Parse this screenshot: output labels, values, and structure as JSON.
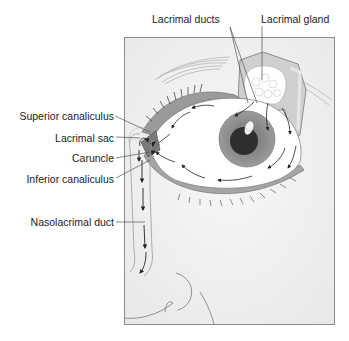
{
  "labels": {
    "lacrimal_ducts": "Lacrimal ducts",
    "lacrimal_gland": "Lacrimal gland",
    "superior_canaliculus": "Superior canaliculus",
    "lacrimal_sac": "Lacrimal sac",
    "caruncle": "Caruncle",
    "inferior_canaliculus": "Inferior canaliculus",
    "nasolacrimal_duct": "Nasolacrimal duct"
  },
  "colors": {
    "frame_bg": "#f2f2f2",
    "frame_border": "#8c8c8c",
    "leader_line": "#555555",
    "iris": "#8a8a8a",
    "pupil": "#2e2e2e",
    "lid_band": "#9a9a9a",
    "gland": "#ffffff",
    "arrow": "#222222"
  }
}
